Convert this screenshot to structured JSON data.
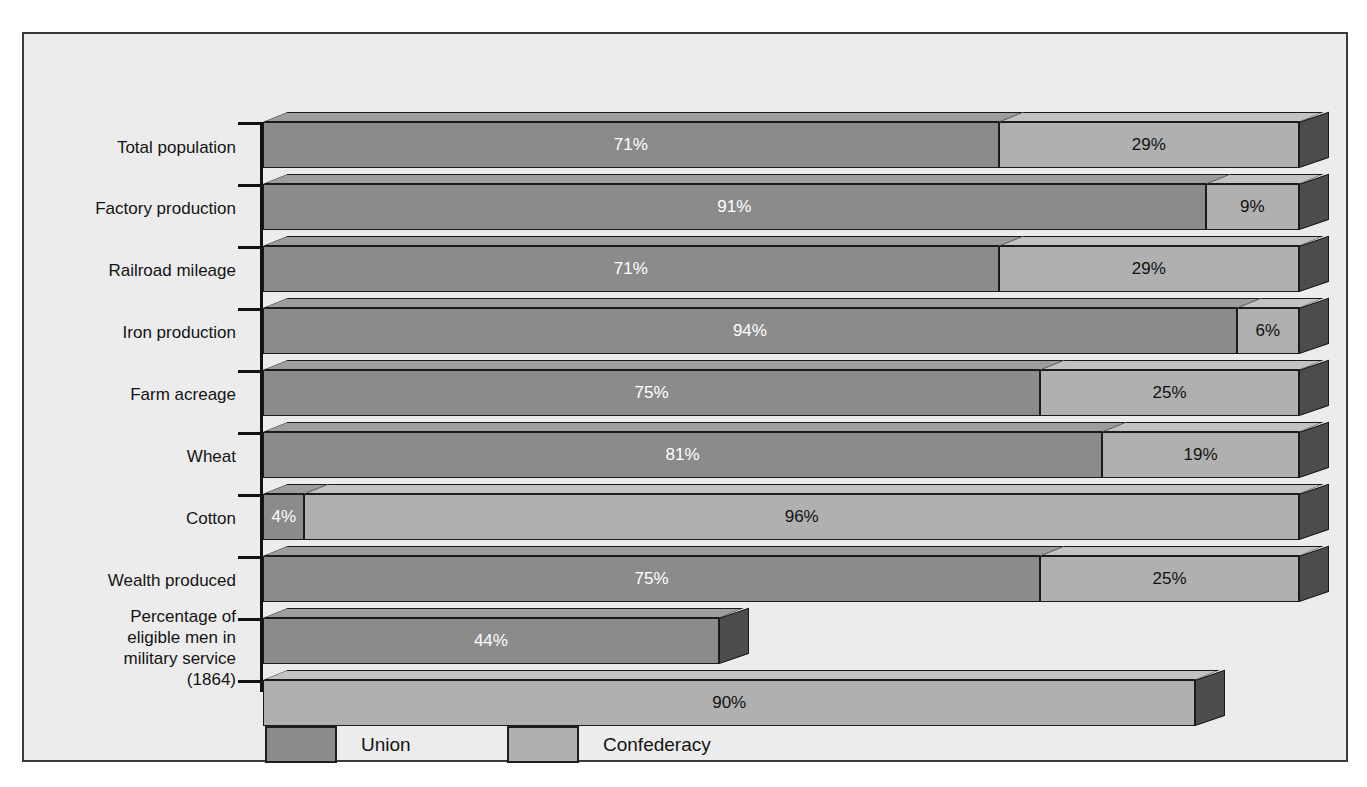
{
  "chart_data": {
    "type": "bar",
    "orientation": "horizontal",
    "subtype": "stacked-3d",
    "title": "",
    "xlabel": "",
    "ylabel": "",
    "xlim": [
      0,
      100
    ],
    "grid": false,
    "legend_position": "bottom",
    "categories": [
      "Total population",
      "Factory production",
      "Railroad mileage",
      "Iron production",
      "Farm acreage",
      "Wheat",
      "Cotton",
      "Wealth produced",
      "Percentage of\neligible men in\nmilitary service\n(1864)"
    ],
    "series": [
      {
        "name": "Union",
        "color": "#8b8b8b",
        "values": [
          71,
          91,
          71,
          94,
          75,
          81,
          4,
          75,
          44
        ]
      },
      {
        "name": "Confederacy",
        "color": "#b0b0b0",
        "values": [
          29,
          9,
          29,
          6,
          25,
          19,
          96,
          25,
          90
        ]
      }
    ],
    "rows": [
      {
        "label": "Total population",
        "union": 71,
        "union_text": "71%",
        "conf": 29,
        "conf_text": "29%",
        "stacked": true
      },
      {
        "label": "Factory production",
        "union": 91,
        "union_text": "91%",
        "conf": 9,
        "conf_text": "9%",
        "stacked": true
      },
      {
        "label": "Railroad mileage",
        "union": 71,
        "union_text": "71%",
        "conf": 29,
        "conf_text": "29%",
        "stacked": true
      },
      {
        "label": "Iron production",
        "union": 94,
        "union_text": "94%",
        "conf": 6,
        "conf_text": "6%",
        "stacked": true
      },
      {
        "label": "Farm acreage",
        "union": 75,
        "union_text": "75%",
        "conf": 25,
        "conf_text": "25%",
        "stacked": true
      },
      {
        "label": "Wheat",
        "union": 81,
        "union_text": "81%",
        "conf": 19,
        "conf_text": "19%",
        "stacked": true
      },
      {
        "label": "Cotton",
        "union": 4,
        "union_text": "4%",
        "conf": 96,
        "conf_text": "96%",
        "stacked": true
      },
      {
        "label": "Wealth produced",
        "union": 75,
        "union_text": "75%",
        "conf": 25,
        "conf_text": "25%",
        "stacked": true
      },
      {
        "label": "Percentage of\neligible men in\nmilitary service\n(1864)",
        "union": 44,
        "union_text": "44%",
        "conf": 90,
        "conf_text": "90%",
        "stacked": false
      }
    ],
    "legend": [
      {
        "name": "Union",
        "color": "#8b8b8b"
      },
      {
        "name": "Confederacy",
        "color": "#b0b0b0"
      }
    ],
    "colors": {
      "union_front": "#8b8b8b",
      "union_top": "#9d9d9d",
      "confederacy_front": "#b0b0b0",
      "confederacy_top": "#c2c2c2",
      "side_shadow": "#4c4c4c",
      "background": "#ececec",
      "border": "#3a3a3a",
      "axis": "#121212"
    }
  },
  "labels": {
    "total_population": "Total population",
    "factory_production": "Factory production",
    "railroad_mileage": "Railroad mileage",
    "iron_production": "Iron production",
    "farm_acreage": "Farm acreage",
    "wheat": "Wheat",
    "cotton": "Cotton",
    "wealth_produced": "Wealth produced",
    "military_service": "Percentage of\neligible men in\nmilitary service\n(1864)"
  },
  "legend": {
    "union_label": "Union",
    "confederacy_label": "Confederacy"
  }
}
